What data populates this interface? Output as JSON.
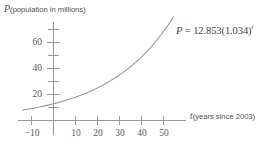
{
  "figure": {
    "title": "",
    "background_color": "#ffffff",
    "line_color": "#9a9a9a",
    "text_color": "#4e4e4e"
  },
  "axes": {
    "y_caption_var": "P",
    "y_caption_text": "(population in millions)",
    "x_caption_var": "t",
    "x_caption_text": "(years since 2003)"
  },
  "equation": {
    "lhs": "P",
    "eq": "=",
    "coefficient": "12.853",
    "open_paren": "(",
    "base": "1.034",
    "close_paren": ")",
    "exponent": "t",
    "full_text": "P = 12.853(1.034)^t"
  },
  "chart_data": {
    "type": "line",
    "title": "",
    "xlabel": "t (years since 2003)",
    "ylabel": "P (population in millions)",
    "xlim": [
      -14,
      56
    ],
    "ylim": [
      0,
      72
    ],
    "grid": false,
    "legend": "none",
    "annotations": [
      {
        "text": "P = 12.853(1.034)^t",
        "x": 48,
        "y": 63
      }
    ],
    "xticks_major": [
      -10,
      10,
      20,
      30,
      40,
      50
    ],
    "xtick_labels": [
      "−10",
      "10",
      "20",
      "30",
      "40",
      "50"
    ],
    "xticks_minor": [
      0
    ],
    "yticks_major": [
      20,
      40,
      60
    ],
    "ytick_labels": [
      "20",
      "40",
      "60"
    ],
    "yticks_minor": [
      10,
      30,
      50,
      70
    ],
    "series": [
      {
        "name": "P = 12.853(1.034)^t",
        "formula": "P = 12.853 * 1.034^t",
        "coefficient": 12.853,
        "base": 1.034,
        "color": "#9a9a9a",
        "x": [
          -14,
          -10,
          -5,
          0,
          5,
          10,
          15,
          20,
          25,
          30,
          35,
          40,
          45,
          50,
          55
        ],
        "y": [
          8.1,
          9.2,
          10.9,
          12.9,
          15.2,
          17.9,
          21.2,
          25.1,
          29.6,
          35.0,
          41.4,
          48.9,
          57.8,
          68.3,
          80.8
        ]
      }
    ]
  }
}
